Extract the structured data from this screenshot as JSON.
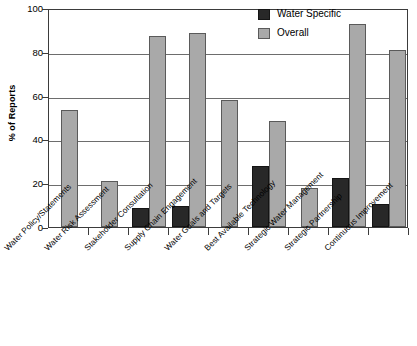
{
  "chart_data": {
    "type": "bar",
    "title": "",
    "xlabel": "",
    "ylabel": "% of Reports",
    "ylim": [
      0,
      100
    ],
    "yticks": [
      0,
      20,
      40,
      60,
      80,
      100
    ],
    "ytick_labels": [
      "0",
      "20",
      "40",
      "60",
      "80",
      "100"
    ],
    "grid": true,
    "legend_position": "top-right",
    "categories": [
      "Water Policy/Statements",
      "Water Risk Assessment",
      "Stakeholder Consultation",
      "Supply Chain Engagement",
      "Water Goals and Targets",
      "Best Available Technology",
      "Strategic Water Management",
      "Strategic Partnership",
      "Continuous Improvement"
    ],
    "series": [
      {
        "name": "Water Specific",
        "color": "#282828",
        "values": [
          0,
          0,
          8.7,
          9.6,
          0,
          27.9,
          0,
          22.4,
          10.5
        ]
      },
      {
        "name": "Overall",
        "color": "#a9a9a9",
        "values": [
          53.4,
          20.8,
          87.4,
          88.8,
          58.2,
          48.2,
          17.8,
          92.5,
          80.8
        ]
      }
    ]
  },
  "axes": {
    "y_title": "% of Reports"
  }
}
